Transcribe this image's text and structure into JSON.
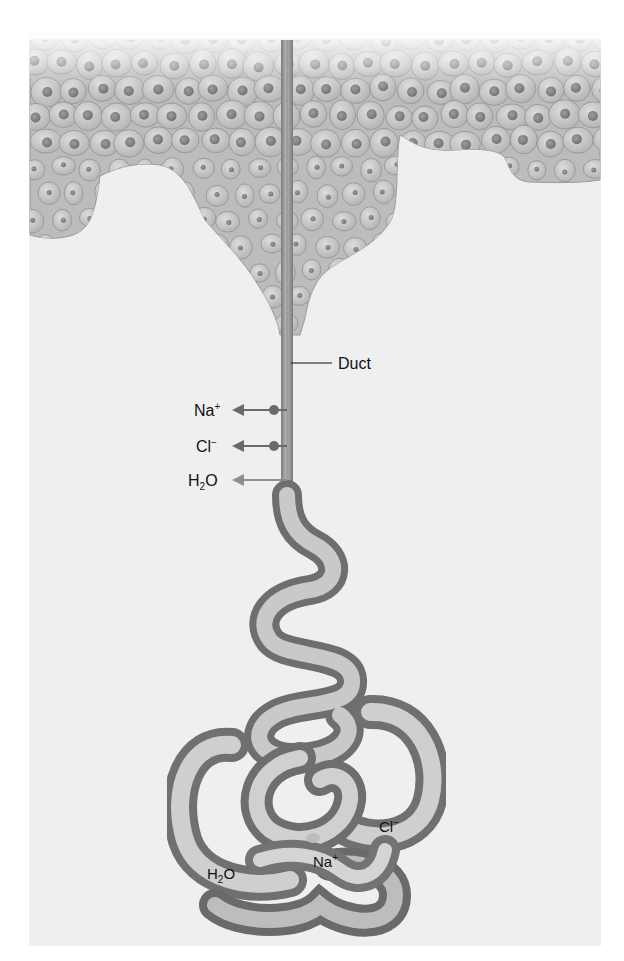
{
  "figure": {
    "structures": {
      "epidermis": "epidermal-cell-layer",
      "duct": "duct",
      "coil": "secretory-coil"
    },
    "duct_label": "Duct",
    "duct_transport": [
      {
        "base": "Na",
        "sup": "+",
        "sub": "",
        "tail": "",
        "carrier": true
      },
      {
        "base": "Cl",
        "sup": "−",
        "sub": "",
        "tail": "",
        "carrier": true
      },
      {
        "base": "H",
        "sup": "",
        "sub": "2",
        "tail": "O",
        "carrier": false
      }
    ],
    "coil_labels": [
      {
        "base": "H",
        "sup": "",
        "sub": "2",
        "tail": "O"
      },
      {
        "base": "Na",
        "sup": "+",
        "sub": "",
        "tail": ""
      },
      {
        "base": "Cl",
        "sup": "−",
        "sub": "",
        "tail": ""
      }
    ],
    "colors": {
      "panel": "#efefef",
      "tissue": "#c4c4c4",
      "cell_border": "#9a9a9a",
      "nucleus": "#8a8a8a",
      "duct": "#9c9c9c",
      "coil_light": "#d8d8d8",
      "coil_dark": "#6e6e6e",
      "arrow": "#6a6a6a",
      "carrier": "#6a6a6a",
      "h2o_arrow": "#8e8e8e",
      "label": "#111111"
    }
  }
}
